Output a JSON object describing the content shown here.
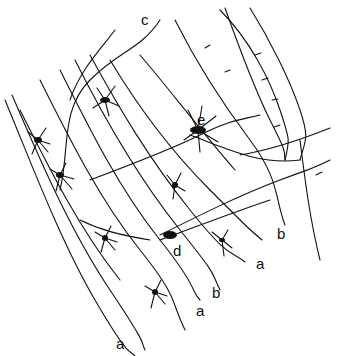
{
  "figure": {
    "labels": [
      {
        "id": "c",
        "text": "c",
        "x": 141,
        "y": 12
      },
      {
        "id": "e",
        "text": "e",
        "x": 197,
        "y": 112
      },
      {
        "id": "d",
        "text": "d",
        "x": 173,
        "y": 243
      },
      {
        "id": "b1",
        "text": "b",
        "x": 277,
        "y": 226
      },
      {
        "id": "a1",
        "text": "a",
        "x": 256,
        "y": 256
      },
      {
        "id": "b2",
        "text": "b",
        "x": 212,
        "y": 285
      },
      {
        "id": "a2",
        "text": "a",
        "x": 196,
        "y": 303
      },
      {
        "id": "a3",
        "text": "a",
        "x": 116,
        "y": 336
      }
    ],
    "colors": {
      "ink": "#111111",
      "background": "#ffffff"
    }
  }
}
